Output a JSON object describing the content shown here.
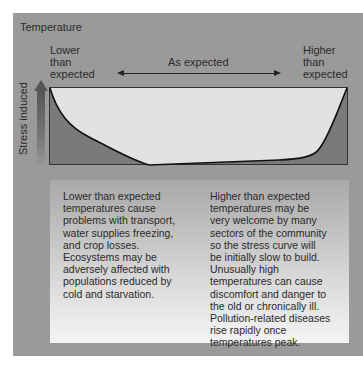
{
  "diagram": {
    "title": "Temperature",
    "x_labels": {
      "lower": "Lower\nthan\nexpected",
      "middle": "As expected",
      "higher": "Higher\nthan\nexpected"
    },
    "y_label": "Stress induced",
    "curve": {
      "description": "U-shaped stress curve: stress high at lower-than-expected temperatures, decreasing to zero across the expected range, then rising steeply at higher-than-expected temperatures",
      "fill_color": "#7a7a7a",
      "background_color": "#e2e2e2"
    },
    "notes": {
      "left": "Lower than expected\ntemperatures cause\nproblems with transport,\nwater supplies freezing,\nand crop losses.\nEcosystems may be\nadversely affected with\npopulations reduced by\ncold and starvation.",
      "right": "Higher than expected\ntemperatures may be\nvery welcome by many\nsectors of the community\nso the stress curve will\nbe initially slow to build.\nUnusually high\ntemperatures can cause\ndiscomfort and danger to\nthe old or chronically ill.\nPollution-related diseases\nrise rapidly once\ntemperatures peak."
    },
    "colors": {
      "panel": "#9a9a9a",
      "text": "#2a2a2a"
    }
  }
}
